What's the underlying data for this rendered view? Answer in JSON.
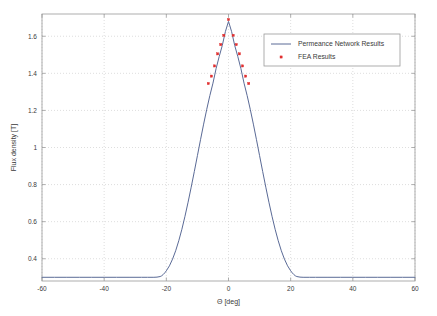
{
  "chart_data": {
    "type": "line",
    "title": "",
    "xlabel": "Θ [deg]",
    "ylabel": "Flux density [T]",
    "xlim": [
      -60,
      60
    ],
    "ylim": [
      0.28,
      1.72
    ],
    "xticks": [
      -60,
      -40,
      -20,
      0,
      20,
      40,
      60
    ],
    "xticklabels": [
      "-60",
      "-40",
      "-20",
      "0",
      "20",
      "40",
      "60"
    ],
    "yticks": [
      0.4,
      0.6,
      0.8,
      1,
      1.2,
      1.4,
      1.6
    ],
    "yticklabels": [
      "0.4",
      "0.6",
      "0.8",
      "1",
      "1.2",
      "1.4",
      "1.6"
    ],
    "grid": true,
    "grid_style": "dotted",
    "legend_position": "upper right",
    "series": [
      {
        "name": "Permeance Network Results",
        "type": "line",
        "color": "#5a6a96",
        "x": [
          -60,
          -56,
          -52,
          -48,
          -44,
          -40,
          -36,
          -32,
          -28,
          -26,
          -24,
          -23,
          -22,
          -21.5,
          -21,
          -20.5,
          -20,
          -19,
          -18,
          -17,
          -16,
          -15,
          -14,
          -13,
          -12,
          -11,
          -10,
          -9,
          -8,
          -7,
          -6,
          -5,
          -4,
          -3,
          -2,
          -1,
          0,
          1,
          2,
          3,
          4,
          5,
          6,
          7,
          8,
          9,
          10,
          11,
          12,
          13,
          14,
          15,
          16,
          17,
          18,
          19,
          20,
          20.5,
          21,
          21.5,
          22,
          23,
          24,
          26,
          28,
          32,
          36,
          40,
          44,
          48,
          52,
          56,
          60
        ],
        "y": [
          0.3,
          0.3,
          0.3,
          0.3,
          0.3,
          0.3,
          0.3,
          0.3,
          0.3,
          0.3,
          0.3,
          0.301,
          0.304,
          0.308,
          0.315,
          0.324,
          0.335,
          0.362,
          0.398,
          0.443,
          0.497,
          0.559,
          0.629,
          0.705,
          0.786,
          0.87,
          0.956,
          1.042,
          1.126,
          1.206,
          1.28,
          1.347,
          1.425,
          1.49,
          1.55,
          1.625,
          1.68,
          1.625,
          1.55,
          1.49,
          1.425,
          1.347,
          1.28,
          1.206,
          1.126,
          1.042,
          0.956,
          0.87,
          0.786,
          0.705,
          0.629,
          0.559,
          0.497,
          0.443,
          0.398,
          0.362,
          0.335,
          0.324,
          0.315,
          0.308,
          0.304,
          0.301,
          0.3,
          0.3,
          0.3,
          0.3,
          0.3,
          0.3,
          0.3,
          0.3,
          0.3,
          0.3,
          0.3
        ]
      },
      {
        "name": "FEA Results",
        "type": "scatter",
        "color": "#e03030",
        "marker": "square",
        "x": [
          -6.5,
          -5.5,
          -4.5,
          -3.5,
          -2.5,
          -1.5,
          0,
          1.5,
          2.5,
          3.5,
          4.5,
          5.5,
          6.5
        ],
        "y": [
          1.345,
          1.385,
          1.44,
          1.505,
          1.555,
          1.605,
          1.69,
          1.605,
          1.555,
          1.505,
          1.44,
          1.385,
          1.345
        ]
      }
    ]
  },
  "legend": {
    "items": [
      {
        "label": "Permeance Network Results",
        "marker": "line",
        "color": "#5a6a96"
      },
      {
        "label": "FEA Results",
        "marker": "square",
        "color": "#e03030"
      }
    ]
  },
  "axes": {
    "x_title": "Θ [deg]",
    "y_title": "Flux density [T]",
    "x_tick_labels": [
      "-60",
      "-40",
      "-20",
      "0",
      "20",
      "40",
      "60"
    ],
    "y_tick_labels": [
      "0.4",
      "0.6",
      "0.8",
      "1",
      "1.2",
      "1.4",
      "1.6"
    ]
  },
  "colors": {
    "line": "#5a6a96",
    "marker": "#e03030",
    "grid": "#c8c8c8",
    "axis": "#9a9a9a",
    "text": "#3a3a3a",
    "background": "#ffffff"
  }
}
